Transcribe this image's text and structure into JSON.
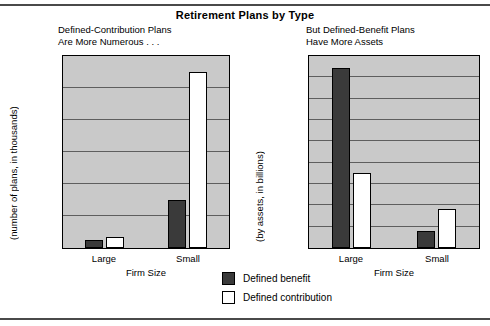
{
  "title": "Retirement Plans by Type",
  "legend": {
    "items": [
      {
        "label": "Defined benefit",
        "color": "#3a3a3a",
        "key": "benefit"
      },
      {
        "label": "Defined contribution",
        "color": "#ffffff",
        "key": "contribution"
      }
    ]
  },
  "panels": {
    "left": {
      "subtitle": "Defined-Contribution Plans\nAre More Numerous . . .",
      "ylabel": "(number of plans, in thousands)",
      "xlabel": "Firm Size",
      "yticks": [
        "0",
        "100",
        "200",
        "300",
        "400",
        "500",
        "600"
      ],
      "xticks": [
        "Large",
        "Small"
      ]
    },
    "right": {
      "subtitle": "But Defined-Benefit Plans\nHave More Assets",
      "ylabel": "(by assets, in billions)",
      "xlabel": "Firm Size",
      "yticks": [
        "0",
        "100",
        "200",
        "300",
        "400",
        "500",
        "600",
        "700",
        "800",
        "$900"
      ],
      "xticks": [
        "Large",
        "Small"
      ]
    }
  },
  "chart_data": [
    {
      "type": "bar",
      "title": "Defined-Contribution Plans Are More Numerous . . .",
      "categories": [
        "Large",
        "Small"
      ],
      "series": [
        {
          "name": "Defined benefit",
          "values": [
            25,
            150
          ]
        },
        {
          "name": "Defined contribution",
          "values": [
            35,
            550
          ]
        }
      ],
      "xlabel": "Firm Size",
      "ylabel": "(number of plans, in thousands)",
      "ylim": [
        0,
        600
      ],
      "ytick_step": 100,
      "grid": true,
      "legend_position": "bottom-center"
    },
    {
      "type": "bar",
      "title": "But Defined-Benefit Plans Have More Assets",
      "categories": [
        "Large",
        "Small"
      ],
      "series": [
        {
          "name": "Defined benefit",
          "values": [
            845,
            80
          ]
        },
        {
          "name": "Defined contribution",
          "values": [
            350,
            185
          ]
        }
      ],
      "xlabel": "Firm Size",
      "ylabel": "(by assets, in billions)",
      "ylim": [
        0,
        900
      ],
      "ytick_step": 100,
      "grid": true,
      "legend_position": "bottom-center"
    }
  ]
}
